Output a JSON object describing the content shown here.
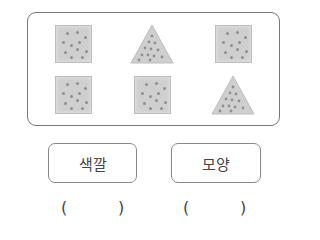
{
  "figure": {
    "shapes": [
      {
        "type": "square",
        "color": "#cfcfcf",
        "row": 1,
        "col": 1
      },
      {
        "type": "triangle",
        "color": "#cfcfcf",
        "row": 1,
        "col": 2
      },
      {
        "type": "square",
        "color": "#cfcfcf",
        "row": 1,
        "col": 3
      },
      {
        "type": "square",
        "color": "#cfcfcf",
        "row": 2,
        "col": 1
      },
      {
        "type": "square",
        "color": "#cfcfcf",
        "row": 2,
        "col": 2
      },
      {
        "type": "triangle",
        "color": "#cfcfcf",
        "row": 2,
        "col": 3
      }
    ]
  },
  "options": [
    {
      "label": "색깔",
      "answer_open": "(",
      "answer_close": ")"
    },
    {
      "label": "모양",
      "answer_open": "(",
      "answer_close": ")"
    }
  ]
}
